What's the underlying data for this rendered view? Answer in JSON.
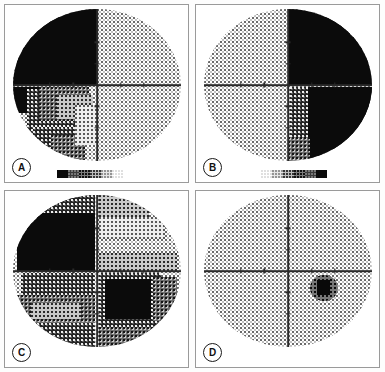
{
  "figure": {
    "title": "",
    "panel_count": 4,
    "layout": "2x2 grid",
    "background_color": "#ffffff",
    "border_color": "#9a9a9a"
  },
  "panels": [
    {
      "id": "A",
      "label": "A",
      "position": "top-left",
      "description": "Visual field grayscale plot with dense absolute defect occupying the entire superior-nasal quadrant and extending into the inferior-nasal quadrant with graded shading",
      "quadrants": {
        "superior_nasal": "absolute defect",
        "superior_temporal": "normal",
        "inferior_nasal": "dense relative defect",
        "inferior_temporal": "normal"
      },
      "defect_side": "left hemifield",
      "blind_spot_visible": false
    },
    {
      "id": "B",
      "label": "B",
      "position": "top-right",
      "description": "Visual field grayscale plot mirrored from A, with absolute defect occupying the entire right hemifield superior quadrant and most of the inferior right quadrant",
      "quadrants": {
        "superior_nasal": "normal",
        "superior_temporal": "absolute defect",
        "inferior_nasal": "normal",
        "inferior_temporal": "absolute defect"
      },
      "defect_side": "right hemifield",
      "blind_spot_visible": false
    },
    {
      "id": "C",
      "label": "C",
      "position": "bottom-left",
      "description": "Visual field grayscale plot with widespread depression across all four quadrants, densest superiorly-nasally and inferiorly-temporally",
      "quadrants": {
        "superior_nasal": "absolute defect",
        "superior_temporal": "mild relative defect",
        "inferior_nasal": "moderate relative defect",
        "inferior_temporal": "dense relative defect"
      },
      "defect_side": "diffuse / all quadrants",
      "blind_spot_visible": false
    },
    {
      "id": "D",
      "label": "D",
      "position": "bottom-right",
      "description": "Essentially normal visual field grayscale plot with only the physiological blind spot visible in the inferior-temporal field",
      "quadrants": {
        "superior_nasal": "normal",
        "superior_temporal": "normal",
        "inferior_nasal": "normal",
        "inferior_temporal": "normal"
      },
      "defect_side": "none",
      "blind_spot_visible": true
    }
  ],
  "legend": {
    "name": "grayscale-sensitivity-scale",
    "description": "Grayscale bar from dense black (absolute defect) to white (normal sensitivity)",
    "swatch_classes": [
      "sw-0",
      "sw-1",
      "sw-2",
      "sw-3",
      "sw-4",
      "sw-5"
    ],
    "swatch_count": 6,
    "dark_end": "absolute defect",
    "light_end": "normal sensitivity"
  },
  "axes": {
    "horizontal_ticks": 4,
    "vertical_ticks": 4,
    "crosshair_color": "#2a2a2a"
  }
}
